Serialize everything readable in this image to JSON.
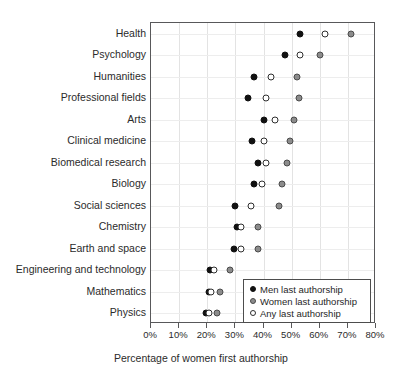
{
  "chart_data": {
    "type": "scatter",
    "orientation": "horizontal",
    "title": "",
    "xlabel": "Percentage of women first authorship",
    "ylabel": "",
    "xlim": [
      0,
      80
    ],
    "xticks": [
      0,
      10,
      20,
      30,
      40,
      50,
      60,
      70,
      80
    ],
    "xtick_labels": [
      "0%",
      "10%",
      "20%",
      "30%",
      "40%",
      "50%",
      "60%",
      "70%",
      "80%"
    ],
    "grid": true,
    "legend_position": "bottom-right",
    "categories": [
      "Health",
      "Psychology",
      "Humanities",
      "Professional fields",
      "Arts",
      "Clinical medicine",
      "Biomedical research",
      "Biology",
      "Social sciences",
      "Chemistry",
      "Earth and space",
      "Engineering and technology",
      "Mathematics",
      "Physics"
    ],
    "series": [
      {
        "name": "Men last authorship",
        "marker": "filled-black",
        "color": "#111111",
        "values": [
          53.0,
          47.5,
          36.5,
          34.5,
          40.0,
          36.0,
          38.0,
          36.5,
          30.0,
          30.5,
          29.5,
          21.0,
          20.5,
          19.5
        ]
      },
      {
        "name": "Women last authorship",
        "marker": "filled-gray",
        "color": "#8c8c8c",
        "values": [
          71.0,
          60.0,
          52.0,
          52.5,
          51.0,
          49.5,
          48.5,
          46.5,
          45.5,
          38.0,
          38.0,
          28.0,
          24.5,
          23.5
        ]
      },
      {
        "name": "Any last authorship",
        "marker": "open",
        "color": "#ffffff",
        "values": [
          62.0,
          53.0,
          42.5,
          41.0,
          44.0,
          40.0,
          41.0,
          39.5,
          35.5,
          32.0,
          32.0,
          22.5,
          21.5,
          20.5
        ]
      }
    ]
  }
}
